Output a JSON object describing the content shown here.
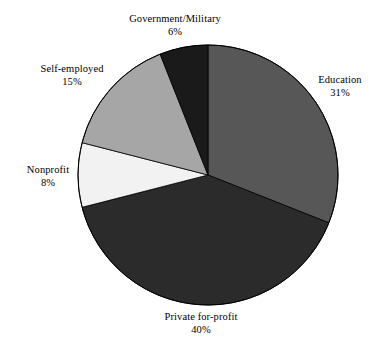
{
  "chart_data": {
    "type": "pie",
    "title": "",
    "categories": [
      "Education",
      "Private for-profit",
      "Nonprofit",
      "Self-employed",
      "Government/Military"
    ],
    "values": [
      31,
      40,
      8,
      15,
      6
    ],
    "value_unit": "%",
    "start_angle_deg": 0,
    "direction": "clockwise",
    "legend": "none",
    "grid": false,
    "slices": [
      {
        "label": "Education",
        "value": 31,
        "value_text": "31%",
        "color": "#575757",
        "start_deg": 0.0,
        "sweep_deg": 111.6
      },
      {
        "label": "Private for-profit",
        "value": 40,
        "value_text": "40%",
        "color": "#2b2b2b",
        "start_deg": 111.6,
        "sweep_deg": 144.0
      },
      {
        "label": "Nonprofit",
        "value": 8,
        "value_text": "8%",
        "color": "#f2f2f2",
        "start_deg": 255.6,
        "sweep_deg": 28.8
      },
      {
        "label": "Self-employed",
        "value": 15,
        "value_text": "15%",
        "color": "#a6a6a6",
        "start_deg": 284.4,
        "sweep_deg": 54.0
      },
      {
        "label": "Government/Military",
        "value": 6,
        "value_text": "6%",
        "color": "#1a1a1a",
        "start_deg": 338.4,
        "sweep_deg": 21.6
      }
    ],
    "outline_color": "#000000"
  },
  "labels": {
    "government": {
      "name": "Government/Military",
      "value": "6%"
    },
    "education": {
      "name": "Education",
      "value": "31%"
    },
    "self": {
      "name": "Self-employed",
      "value": "15%"
    },
    "nonprofit": {
      "name": "Nonprofit",
      "value": "8%"
    },
    "private": {
      "name": "Private for-profit",
      "value": "40%"
    }
  }
}
